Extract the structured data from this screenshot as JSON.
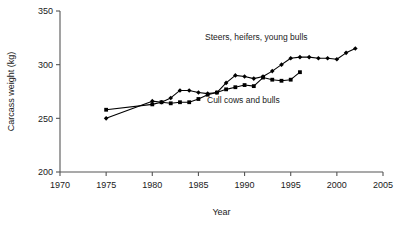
{
  "chart_data": {
    "type": "line",
    "title": "",
    "xlabel": "Year",
    "ylabel": "Carcass weight (kg)",
    "xlim": [
      1970,
      2005
    ],
    "ylim": [
      200,
      350
    ],
    "xticks": [
      1970,
      1975,
      1980,
      1985,
      1990,
      1995,
      2000,
      2005
    ],
    "yticks": [
      200,
      250,
      300,
      350
    ],
    "grid": false,
    "legend_position": "inline-annotations",
    "series": [
      {
        "name": "Steers, heifers, young bulls",
        "label_text": "Steers, heifers, young bulls",
        "marker": "filled-diamond",
        "color": "#000000",
        "x": [
          1975,
          1980,
          1981,
          1982,
          1983,
          1984,
          1985,
          1986,
          1987,
          1988,
          1989,
          1990,
          1991,
          1992,
          1993,
          1994,
          1995,
          1996,
          1997,
          1998,
          1999,
          2000,
          2001,
          2002
        ],
        "values": [
          250,
          266,
          265,
          269,
          276,
          276,
          274,
          273,
          274,
          283,
          290,
          289,
          287,
          289,
          294,
          300,
          306,
          307,
          307,
          306,
          306,
          305,
          311,
          315
        ]
      },
      {
        "name": "Cull cows and bulls",
        "label_text": "Cull cows and bulls",
        "marker": "filled-square",
        "color": "#000000",
        "x": [
          1975,
          1980,
          1981,
          1982,
          1983,
          1984,
          1985,
          1986,
          1987,
          1988,
          1989,
          1990,
          1991,
          1992,
          1993,
          1994,
          1995,
          1996
        ],
        "values": [
          258,
          263,
          265,
          264,
          265,
          265,
          268,
          272,
          274,
          277,
          279,
          281,
          280,
          288,
          286,
          285,
          286,
          293
        ]
      }
    ],
    "annotations": [
      {
        "text": "Steers, heifers, young bulls",
        "x_px": 205,
        "y_px": 40
      },
      {
        "text": "Cull cows and bulls",
        "x_px": 207,
        "y_px": 103
      }
    ]
  },
  "axes": {
    "y_axis_title": "Carcass weight (kg)",
    "x_axis_title": "Year",
    "y_tick_labels": [
      "350",
      "300",
      "250",
      "200"
    ],
    "x_tick_labels": [
      "1970",
      "1975",
      "1980",
      "1985",
      "1990",
      "1995",
      "2000",
      "2005"
    ]
  }
}
